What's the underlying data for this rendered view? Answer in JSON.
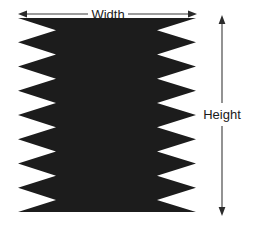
{
  "figure": {
    "background_color": "#ffffff",
    "shape_color": "#1c1c1c",
    "annotation_color": "#2b2b2b",
    "text_color": "#1a1a1a"
  },
  "annotations": {
    "width": {
      "label": "Width",
      "icon_left": "arrow-left-icon",
      "icon_right": "arrow-right-icon",
      "orientation": "horizontal"
    },
    "height": {
      "label": "Height",
      "icon_top": "arrow-up-icon",
      "icon_bottom": "arrow-down-icon",
      "orientation": "vertical"
    }
  },
  "chart_data": {
    "type": "diagram",
    "shape": {
      "left_edge_x": 18,
      "right_edge_x": 196,
      "top_y": 18,
      "bottom_y": 212,
      "left_notch_tip_x": 56,
      "right_notch_tip_x": 157,
      "teeth_count": 8,
      "tooth_period_px": 24.25,
      "phase": "in-phase"
    },
    "width_arrow": {
      "y": 14,
      "x_start": 18,
      "x_end": 197,
      "label": "Width"
    },
    "height_arrow": {
      "x": 222,
      "y_start": 20,
      "y_end": 211,
      "label": "Height"
    }
  }
}
